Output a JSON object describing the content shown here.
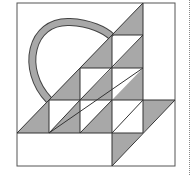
{
  "diagram": {
    "colors": {
      "background": "#ffffff",
      "fill": "#a8a8a8",
      "line": "#333333",
      "frame": "#555555",
      "handle_fill": "#a8a8a8"
    },
    "grid": {
      "x": [
        17,
        49,
        80,
        112,
        143,
        175
      ],
      "y": [
        3,
        35,
        68,
        100,
        133,
        166
      ]
    },
    "shaded_triangles": [
      "143,3 112,35 143,35",
      "112,35 80,68 112,68",
      "143,35 112,68 143,68",
      "80,68 49,100 80,100",
      "112,68 80,100 112,100",
      "143,68 112,100 143,100",
      "49,100 17,133 49,133",
      "80,100 49,133 80,133",
      "112,100 80,133 112,133",
      "175,100 143,133 143,100",
      "143,133 112,166 112,133"
    ],
    "outline_lines": [
      "143,3 143,133",
      "112,35 112,166",
      "80,68 80,133",
      "49,100 49,133",
      "112,35 143,35",
      "80,68 143,68",
      "49,100 175,100",
      "17,133 143,133",
      "143,3 17,133",
      "143,35 80,100",
      "143,68 49,133",
      "143,100 112,133",
      "112,100 80,133",
      "175,100 112,166",
      "80,100 49,133"
    ],
    "handle": {
      "path": "M 49 100 C 20 70, 30 20, 70 22 C 90 23, 105 30, 112 37"
    },
    "separator": "dotted-vertical-line"
  }
}
